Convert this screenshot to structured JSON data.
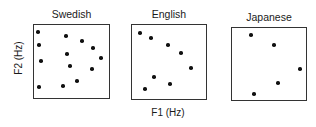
{
  "chart_data": [
    {
      "type": "scatter",
      "title": "Swedish",
      "xlabel": "F1 (Hz)",
      "ylabel": "F2 (Hz)",
      "grid": false,
      "box": {
        "left": 33,
        "top": 24,
        "right": 110,
        "bottom": 99
      },
      "points_px": [
        [
          38,
          32
        ],
        [
          66,
          36
        ],
        [
          82,
          41
        ],
        [
          39,
          45
        ],
        [
          93,
          48
        ],
        [
          67,
          54
        ],
        [
          41,
          61
        ],
        [
          101,
          58
        ],
        [
          70,
          66
        ],
        [
          92,
          69
        ],
        [
          77,
          81
        ],
        [
          39,
          87
        ],
        [
          63,
          86
        ]
      ]
    },
    {
      "type": "scatter",
      "title": "English",
      "xlabel": "F1 (Hz)",
      "ylabel": "F2 (Hz)",
      "grid": false,
      "box": {
        "left": 131,
        "top": 24,
        "right": 207,
        "bottom": 100
      },
      "points_px": [
        [
          140,
          33
        ],
        [
          151,
          38
        ],
        [
          168,
          45
        ],
        [
          181,
          53
        ],
        [
          191,
          68
        ],
        [
          154,
          77
        ],
        [
          170,
          84
        ],
        [
          145,
          89
        ]
      ]
    },
    {
      "type": "scatter",
      "title": "Japanese",
      "xlabel": "F1 (Hz)",
      "ylabel": "F2 (Hz)",
      "grid": false,
      "box": {
        "left": 231,
        "top": 27,
        "right": 307,
        "bottom": 101
      },
      "points_px": [
        [
          251,
          35
        ],
        [
          274,
          45
        ],
        [
          300,
          69
        ],
        [
          278,
          83
        ],
        [
          254,
          94
        ]
      ]
    }
  ],
  "labels": {
    "y_axis": "F2 (Hz)",
    "x_axis": "F1 (Hz)",
    "titles": [
      "Swedish",
      "English",
      "Japanese"
    ]
  }
}
